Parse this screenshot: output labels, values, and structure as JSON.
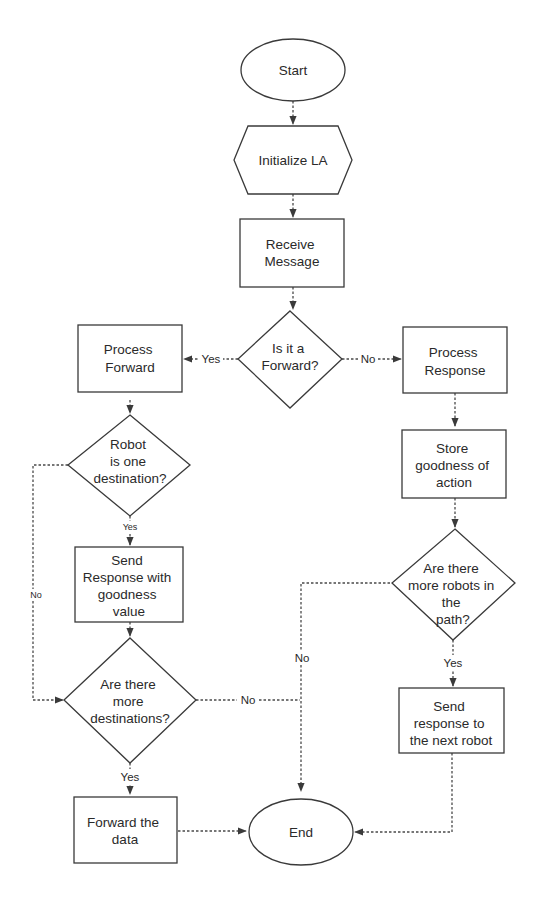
{
  "diagram": {
    "type": "flowchart",
    "colors": {
      "stroke": "#3a3a3a",
      "text": "#2a2a2a",
      "background": "#ffffff"
    },
    "nodes": {
      "start": {
        "shape": "ellipse",
        "lines": [
          "Start"
        ]
      },
      "init": {
        "shape": "hexagon",
        "lines": [
          "Initialize LA"
        ]
      },
      "receive": {
        "shape": "rect",
        "lines": [
          "Receive",
          "Message"
        ]
      },
      "is_forward": {
        "shape": "diamond",
        "lines": [
          "Is it a",
          "Forward?"
        ]
      },
      "process_forward": {
        "shape": "rect",
        "lines": [
          "Process",
          "Forward"
        ]
      },
      "process_response": {
        "shape": "rect",
        "lines": [
          "Process",
          "Response"
        ]
      },
      "robot_dest": {
        "shape": "diamond",
        "lines": [
          "Robot",
          "is one",
          "destination?"
        ]
      },
      "store_goodness": {
        "shape": "rect",
        "lines": [
          "Store",
          "goodness of",
          "action"
        ]
      },
      "send_response_goodness": {
        "shape": "rect",
        "lines": [
          "Send",
          "Response with",
          "goodness",
          "value"
        ]
      },
      "more_robots": {
        "shape": "diamond",
        "lines": [
          "Are there",
          "more robots in",
          "the",
          "path?"
        ]
      },
      "more_destinations": {
        "shape": "diamond",
        "lines": [
          "Are there",
          "more",
          "destinations?"
        ]
      },
      "send_next": {
        "shape": "rect",
        "lines": [
          "Send",
          "response to",
          "the next robot"
        ]
      },
      "forward_data": {
        "shape": "rect",
        "lines": [
          "Forward the",
          "data"
        ]
      },
      "end": {
        "shape": "ellipse",
        "lines": [
          "End"
        ]
      }
    },
    "edges": {
      "is_forward_yes": {
        "from": "is_forward",
        "to": "process_forward",
        "label": "Yes"
      },
      "is_forward_no": {
        "from": "is_forward",
        "to": "process_response",
        "label": "No"
      },
      "robot_dest_yes": {
        "from": "robot_dest",
        "to": "send_response_goodness",
        "label": "Yes"
      },
      "robot_dest_no": {
        "from": "robot_dest",
        "to": "more_destinations",
        "label": "No"
      },
      "more_dest_yes": {
        "from": "more_destinations",
        "to": "forward_data",
        "label": "Yes"
      },
      "more_dest_no": {
        "from": "more_destinations",
        "to": "end",
        "label": "No"
      },
      "more_robots_yes": {
        "from": "more_robots",
        "to": "send_next",
        "label": "Yes"
      },
      "more_robots_no": {
        "from": "more_robots",
        "to": "end",
        "label": "No"
      }
    }
  }
}
